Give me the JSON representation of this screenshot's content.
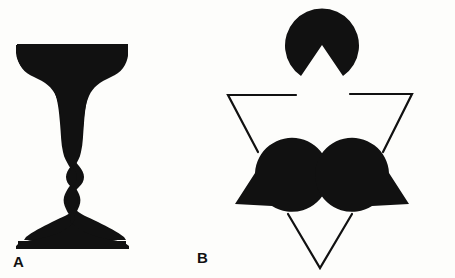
{
  "figure": {
    "background_color": "#fdfdfb",
    "ink_color": "#111111",
    "width": 455,
    "height": 278,
    "panels": [
      {
        "id": "A",
        "label": "A",
        "name": "rubin-vase-illusion",
        "description": "Rubin face-vase ambiguous figure: a black silhouette that reads either as a goblet/vase or as two facing profiles."
      },
      {
        "id": "B",
        "label": "B",
        "name": "kanizsa-triangle-illusion",
        "description": "Kanizsa triangle: three black pac-man discs with wedge notches plus three angle line segments induce an illusory white triangle.",
        "pacman_count": 3,
        "line_segment_count": 3,
        "pacmen": [
          {
            "name": "pacman-top",
            "center_x": 322,
            "center_y": 45,
            "radius": 37,
            "wedge_start_deg": 55,
            "wedge_end_deg": 125
          },
          {
            "name": "pacman-bottom-left",
            "center_x": 235,
            "center_y": 204,
            "radius": 37,
            "wedge_start_deg": -58,
            "wedge_end_deg": 2
          },
          {
            "name": "pacman-bottom-right",
            "center_x": 409,
            "center_y": 204,
            "radius": 37,
            "wedge_start_deg": 178,
            "wedge_end_deg": 238
          }
        ],
        "outline_triangle": {
          "name": "kanizsa-outline-triangle",
          "stroke_width": 2.2,
          "vertices": [
            {
              "x": 228,
              "y": 95
            },
            {
              "x": 412,
              "y": 94
            },
            {
              "x": 320,
              "y": 268
            }
          ],
          "gaps": [
            {
              "side": "top",
              "from_x": 296,
              "to_x": 350
            },
            {
              "side": "left",
              "from_y": 152,
              "to_y": 214
            },
            {
              "side": "right",
              "from_y": 152,
              "to_y": 214
            }
          ]
        }
      }
    ]
  }
}
